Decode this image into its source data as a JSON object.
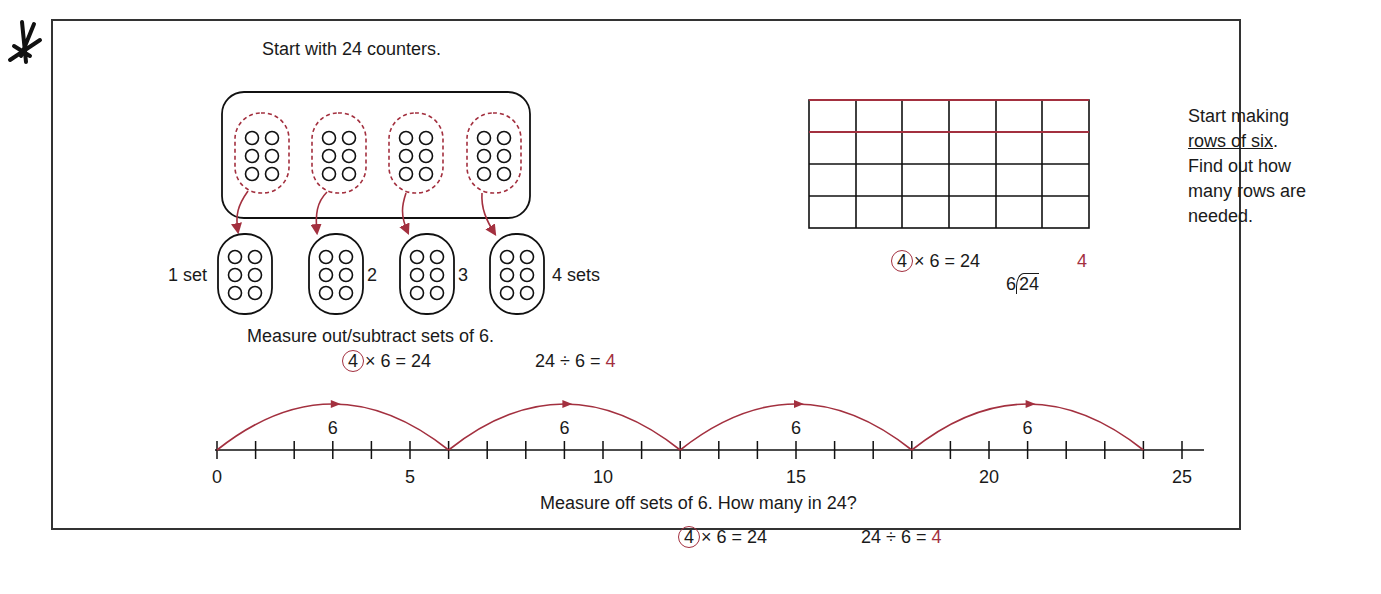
{
  "margin_mark": "*",
  "counters_model": {
    "title": "Start with 24 counters.",
    "total_counters": 24,
    "group_size": 6,
    "groups": 4,
    "set_labels": [
      "1 set",
      "2",
      "3",
      "4 sets"
    ],
    "caption": "Measure out/subtract sets of 6.",
    "multiplication": {
      "circled": "4",
      "rest": "× 6 = 24"
    },
    "division": {
      "lhs": "24 ÷ 6 = ",
      "answer": "4"
    }
  },
  "array_model": {
    "rows": 4,
    "columns": 6,
    "highlighted_row": 1,
    "note_line1": "Start making",
    "note_underlined": "rows of six",
    "note_period": ".",
    "note_line3": "Find out how",
    "note_line4": "many rows are",
    "note_line5": "needed.",
    "multiplication": {
      "circled": "4",
      "rest": "× 6 = 24"
    },
    "long_division": {
      "quotient": "4",
      "divisor": "6",
      "dividend": "24"
    }
  },
  "number_line": {
    "min": 0,
    "max": 25,
    "tick_step": 1,
    "labels": [
      "0",
      "5",
      "10",
      "15",
      "20",
      "25"
    ],
    "jumps": [
      {
        "from": 0,
        "to": 6,
        "label": "6"
      },
      {
        "from": 6,
        "to": 12,
        "label": "6"
      },
      {
        "from": 12,
        "to": 18,
        "label": "6"
      },
      {
        "from": 18,
        "to": 24,
        "label": "6"
      }
    ],
    "caption": "Measure off sets of 6. How many in 24?",
    "multiplication": {
      "circled": "4",
      "rest": "× 6 = 24"
    },
    "division": {
      "lhs": "24 ÷ 6 = ",
      "answer": "4"
    }
  },
  "colors": {
    "accent_red": "#a3303f",
    "ink": "#1a1a1a",
    "frame": "#333333"
  }
}
